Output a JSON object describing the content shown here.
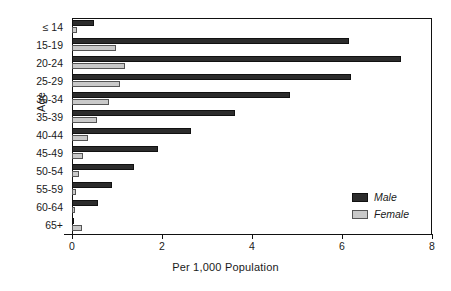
{
  "chart_data": {
    "type": "bar",
    "orientation": "horizontal",
    "title": "",
    "xlabel": "Per 1,000 Population",
    "ylabel": "Age",
    "categories": [
      "≤ 14",
      "15-19",
      "20-24",
      "25-29",
      "30-34",
      "35-39",
      "40-44",
      "45-49",
      "50-54",
      "55-59",
      "60-64",
      "65+"
    ],
    "series": [
      {
        "name": "Male",
        "color": "#2c2c2c",
        "values": [
          0.48,
          6.15,
          7.3,
          6.2,
          4.85,
          3.62,
          2.65,
          1.92,
          1.38,
          0.88,
          0.58,
          0.04
        ]
      },
      {
        "name": "Female",
        "color": "#c9c9c9",
        "values": [
          0.1,
          0.97,
          1.18,
          1.06,
          0.82,
          0.55,
          0.36,
          0.25,
          0.16,
          0.09,
          0.06,
          0.22
        ]
      }
    ],
    "xlim": [
      0,
      8
    ],
    "xticks": [
      0,
      2,
      4,
      6,
      8
    ],
    "xticklabels": [
      "0",
      "2",
      "4",
      "6",
      "8"
    ],
    "grid": false,
    "legend_position": "bottom-right",
    "legend_entries": [
      "Male",
      "Female"
    ]
  }
}
